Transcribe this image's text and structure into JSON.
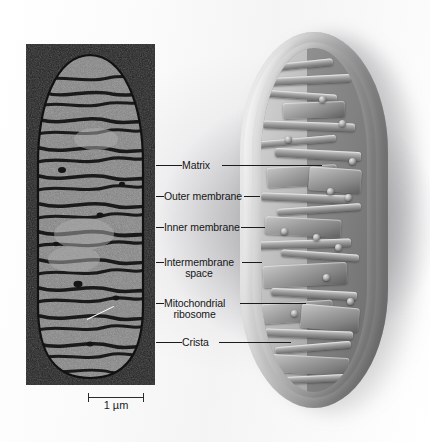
{
  "figure": {
    "panels": {
      "micrograph": {
        "name": "transmission electron micrograph of a mitochondrion",
        "scale_bar": {
          "length_label": "1 µm"
        }
      },
      "model": {
        "name": "cutaway three-dimensional model of a mitochondrion"
      }
    },
    "labels": [
      {
        "id": "matrix",
        "line1": "Matrix",
        "line2": ""
      },
      {
        "id": "outer-membrane",
        "line1": "Outer membrane",
        "line2": ""
      },
      {
        "id": "inner-membrane",
        "line1": "Inner membrane",
        "line2": ""
      },
      {
        "id": "intermembrane-space",
        "line1": "Intermembrane",
        "line2": "space"
      },
      {
        "id": "mitochondrial-ribosome",
        "line1": "Mitochondrial",
        "line2": "ribosome"
      },
      {
        "id": "crista",
        "line1": "Crista",
        "line2": ""
      }
    ],
    "colors": {
      "background": "#ffffff",
      "micrograph_background": "#1d1d1d",
      "label_text": "#161616",
      "leader_line": "#1b1b1b",
      "model_membrane": "#d7d7d7",
      "model_matrix": "#8d8d8d"
    }
  }
}
